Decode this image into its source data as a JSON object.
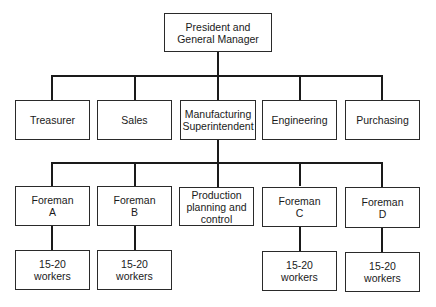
{
  "diagram": {
    "type": "organization-chart",
    "root": {
      "line1": "President and",
      "line2": "General Manager"
    },
    "departments": [
      {
        "id": "treasurer",
        "line1": "Treasurer",
        "line2": ""
      },
      {
        "id": "sales",
        "line1": "Sales",
        "line2": ""
      },
      {
        "id": "manufacturing",
        "line1": "Manufacturing",
        "line2": "Superintendent"
      },
      {
        "id": "engineering",
        "line1": "Engineering",
        "line2": ""
      },
      {
        "id": "purchasing",
        "line1": "Purchasing",
        "line2": ""
      }
    ],
    "manufacturing_units": [
      {
        "id": "foreman-a",
        "line1": "Foreman",
        "line2": "A",
        "line3": ""
      },
      {
        "id": "foreman-b",
        "line1": "Foreman",
        "line2": "B",
        "line3": ""
      },
      {
        "id": "production-planning",
        "line1": "Production",
        "line2": "planning and",
        "line3": "control"
      },
      {
        "id": "foreman-c",
        "line1": "Foreman",
        "line2": "C",
        "line3": ""
      },
      {
        "id": "foreman-d",
        "line1": "Foreman",
        "line2": "D",
        "line3": ""
      }
    ],
    "worker_groups": [
      {
        "id": "workers-a",
        "line1": "15-20",
        "line2": "workers",
        "reports_to": "foreman-a"
      },
      {
        "id": "workers-b",
        "line1": "15-20",
        "line2": "workers",
        "reports_to": "foreman-b"
      },
      {
        "id": "workers-c",
        "line1": "15-20",
        "line2": "workers",
        "reports_to": "foreman-c"
      },
      {
        "id": "workers-d",
        "line1": "15-20",
        "line2": "workers",
        "reports_to": "foreman-d"
      }
    ]
  }
}
